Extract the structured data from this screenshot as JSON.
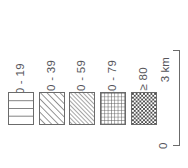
{
  "legend": {
    "classes": [
      {
        "label": "0 - 19",
        "pattern": "horizontal-lines-pattern"
      },
      {
        "label": "20 - 39",
        "pattern": "diagonal-hatch-pattern"
      },
      {
        "label": "40 - 59",
        "pattern": "diagonal-hatch-dense-pattern"
      },
      {
        "label": "60 - 79",
        "pattern": "grid-crosshatch-pattern"
      },
      {
        "label": "≥ 80",
        "pattern": "checkerboard-pattern"
      }
    ]
  },
  "scalebar": {
    "distance_label": "3 km",
    "origin_label": "0"
  },
  "colors": {
    "ink": "#6b6b6b",
    "text": "#55555a",
    "background": "#ffffff"
  }
}
